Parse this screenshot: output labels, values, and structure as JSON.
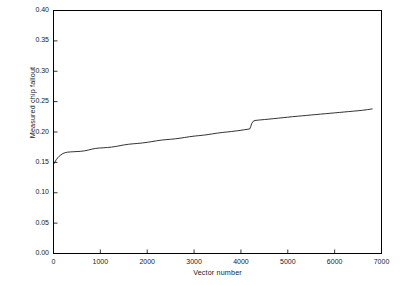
{
  "chart_data": {
    "type": "line",
    "title": "",
    "xlabel": "Vector number",
    "ylabel": "Measured chip fallout",
    "xlim": [
      0,
      7000
    ],
    "ylim": [
      0.0,
      0.4
    ],
    "grid": false,
    "legend": null,
    "xticks": [
      0,
      1000,
      2000,
      3000,
      4000,
      5000,
      6000,
      7000
    ],
    "xtick_labels": [
      "0",
      "1000",
      "2000",
      "3000",
      "4000",
      "5000",
      "6000",
      "7000"
    ],
    "yticks": [
      0.0,
      0.05,
      0.1,
      0.15,
      0.2,
      0.25,
      0.3,
      0.35,
      0.4
    ],
    "ytick_labels": [
      "0.00",
      "0.05",
      "0.10",
      "0.15",
      "0.20",
      "0.25",
      "0.30",
      "0.35",
      "0.40"
    ],
    "line_color": "#000000",
    "line_width": 0.8,
    "series": [
      {
        "name": "Measured chip fallout",
        "x": [
          0,
          30,
          60,
          90,
          120,
          160,
          200,
          250,
          300,
          360,
          420,
          500,
          580,
          660,
          740,
          820,
          900,
          980,
          1060,
          1150,
          1240,
          1330,
          1420,
          1510,
          1600,
          1700,
          1800,
          1900,
          2000,
          2100,
          2200,
          2300,
          2400,
          2500,
          2600,
          2700,
          2800,
          2900,
          3000,
          3100,
          3200,
          3300,
          3400,
          3500,
          3600,
          3700,
          3800,
          3900,
          4000,
          4080,
          4150,
          4190,
          4210,
          4230,
          4260,
          4300,
          4400,
          4500,
          4600,
          4700,
          4800,
          4900,
          5000,
          5100,
          5200,
          5300,
          5400,
          5500,
          5600,
          5700,
          5800,
          5900,
          6000,
          6100,
          6200,
          6300,
          6400,
          6500,
          6600,
          6700,
          6800
        ],
        "y": [
          0.1465,
          0.1505,
          0.1545,
          0.1575,
          0.16,
          0.1625,
          0.1645,
          0.166,
          0.1668,
          0.1672,
          0.1675,
          0.1678,
          0.1682,
          0.169,
          0.1702,
          0.1718,
          0.173,
          0.1736,
          0.174,
          0.1745,
          0.1752,
          0.1762,
          0.1775,
          0.1788,
          0.1798,
          0.1806,
          0.1812,
          0.182,
          0.183,
          0.1842,
          0.1855,
          0.1866,
          0.1874,
          0.188,
          0.1888,
          0.1898,
          0.191,
          0.1922,
          0.1932,
          0.194,
          0.1948,
          0.1958,
          0.197,
          0.1982,
          0.1992,
          0.2,
          0.2008,
          0.2018,
          0.2028,
          0.2038,
          0.2046,
          0.2052,
          0.209,
          0.214,
          0.2175,
          0.219,
          0.2198,
          0.2205,
          0.2212,
          0.222,
          0.2228,
          0.2236,
          0.2244,
          0.2252,
          0.2259,
          0.2266,
          0.2273,
          0.228,
          0.2287,
          0.2294,
          0.2301,
          0.2308,
          0.2315,
          0.2322,
          0.2329,
          0.2336,
          0.2343,
          0.235,
          0.2358,
          0.2368,
          0.238
        ]
      }
    ],
    "annotations": {
      "start_value": "0.1465",
      "end_value": "0.2380",
      "step_vector": "4200"
    }
  }
}
